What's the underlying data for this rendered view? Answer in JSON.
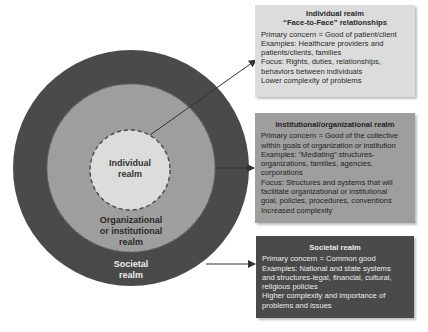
{
  "colors": {
    "outer_ring": "#4a4a4a",
    "middle_ring": "#9e9e9e",
    "inner_circle": "#dcdcdc",
    "arrow": "#333333"
  },
  "circles": {
    "inner_label_1": "Individual",
    "inner_label_2": "realm",
    "middle_label_1": "Organizational",
    "middle_label_2": "or institutional",
    "middle_label_3": "realm",
    "outer_label_1": "Societal",
    "outer_label_2": "realm"
  },
  "boxes": {
    "individual": {
      "title_1": "Individual realm",
      "title_2": "“Face-to-Face” relationships",
      "lines": [
        "Primary concern = Good of patient/client",
        "Examples: Healthcare providers and",
        "patients/clients, families",
        "Focus: Rights, duties, relationships,",
        "behaviors between individuals",
        "Lower complexity of problems"
      ]
    },
    "institutional": {
      "title": "Institutional/organizational realm",
      "lines": [
        "Primary concern = Good of the collective",
        "within goals of organization or institution",
        "Examples: “Mediating” structures-",
        "organizations, families, agencies,",
        "corporations",
        "Focus: Structures and systems that will",
        "facilitate organizational or institutional",
        "goal, policies, procedures, conventions",
        "Increased complexity"
      ]
    },
    "societal": {
      "title": "Societal realm",
      "lines": [
        "Primary concern = Common good",
        "Examples: National and state systems",
        "and structures-legal, financial, cultural,",
        "religious policies",
        "Higher complexity and importance of",
        "problems and issues"
      ]
    }
  }
}
